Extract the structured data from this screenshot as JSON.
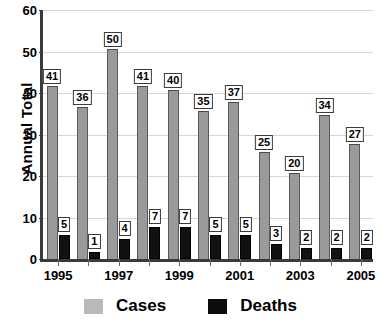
{
  "chart_data": {
    "type": "bar",
    "title": "",
    "xlabel": "",
    "ylabel": "Annual Total",
    "ylim": [
      0,
      60
    ],
    "ytick_step": 10,
    "yticks": [
      0,
      10,
      20,
      30,
      40,
      50,
      60
    ],
    "grid": true,
    "legend_position": "bottom",
    "categories": [
      "1995",
      "1996",
      "1997",
      "1998",
      "1999",
      "2000",
      "2001",
      "2002",
      "2003",
      "2004",
      "2005"
    ],
    "xtick_labels": [
      "1995",
      "1997",
      "1999",
      "2001",
      "2003",
      "2005"
    ],
    "series": [
      {
        "name": "Cases",
        "color": "#9a9a9a",
        "values": [
          41,
          36,
          50,
          41,
          40,
          35,
          37,
          25,
          20,
          34,
          27
        ]
      },
      {
        "name": "Deaths",
        "color": "#111111",
        "values": [
          5,
          1,
          4,
          7,
          7,
          5,
          5,
          3,
          2,
          2,
          2
        ]
      }
    ]
  },
  "legend": {
    "items": [
      {
        "label": "Cases",
        "swatch": "cases-swatch"
      },
      {
        "label": "Deaths",
        "swatch": "deaths-swatch"
      }
    ]
  },
  "axis": {
    "y_title": "Annual Total"
  }
}
